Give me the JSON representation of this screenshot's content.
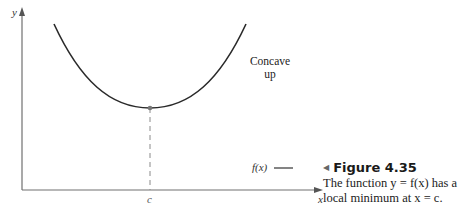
{
  "diagram": {
    "axes": {
      "x_label": "x",
      "y_label": "y"
    },
    "tick_labels": {
      "c": "c"
    },
    "curve_annotation": {
      "line1": "Concave",
      "line2": "up"
    },
    "legend": {
      "label": "f(x)"
    },
    "colors": {
      "curve": "#2a2a2a",
      "axis": "#707070",
      "dashed": "#8a8a8a",
      "point": "#777777"
    }
  },
  "caption": {
    "marker": "◀",
    "title": "Figure 4.35",
    "line1": "The function y = f(x) has a",
    "line2": "local minimum at x = c."
  }
}
